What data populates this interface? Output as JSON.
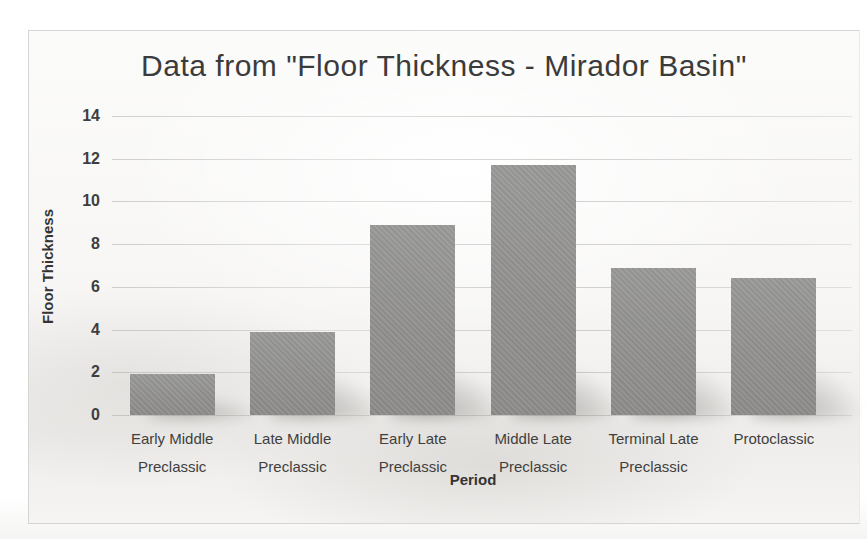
{
  "chart_data": {
    "type": "bar",
    "title": "Data from \"Floor Thickness - Mirador Basin\"",
    "xlabel": "Period",
    "ylabel": "Floor Thickness",
    "categories": [
      "Early Middle Preclassic",
      "Late Middle Preclassic",
      "Early Late Preclassic",
      "Middle Late Preclassic",
      "Terminal Late Preclassic",
      "Protoclassic"
    ],
    "values": [
      1.9,
      3.9,
      8.9,
      11.7,
      6.9,
      6.4
    ],
    "ylim": [
      0,
      14
    ],
    "ytick_step": 2,
    "yticks": [
      0,
      2,
      4,
      6,
      8,
      10,
      12,
      14
    ],
    "grid": true,
    "legend": "none",
    "bar_color": "#929190",
    "gridline_color": "#aFACA8",
    "title_color": "#3b3b3b",
    "appearance": "grayscale scanned photo of an Excel bar chart"
  }
}
